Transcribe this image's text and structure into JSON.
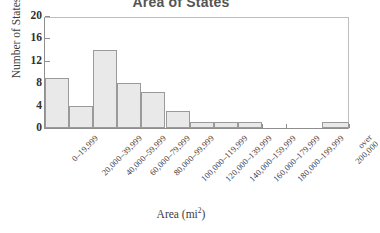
{
  "chart_data": {
    "type": "bar",
    "title": "Area of States",
    "xlabel": "Area (mi",
    "xlabel_sup": "2",
    "xlabel_tail": ")",
    "ylabel": "Number of States",
    "ylim": [
      0,
      20
    ],
    "yticks": [
      0,
      4,
      8,
      12,
      16,
      20
    ],
    "ytick_labels": [
      "0",
      "4",
      "8",
      "12",
      "16",
      "20"
    ],
    "grid": false,
    "legend": "none",
    "bar_color": "#e9e9e9",
    "bar_border_color": "#9a9a9a",
    "axis_color": "#8e8e8e",
    "categories": [
      "0–19,999",
      "20,000–39,999",
      "40,000–59,999",
      "60,000–79,999",
      "80,000–99,999",
      "100,000–119,999",
      "120,000–139,999",
      "140,000–159,999",
      "160,000–179,999",
      "180,000–199,999",
      "over\n200,000"
    ],
    "values": [
      9,
      4,
      14,
      8,
      6.5,
      3,
      1,
      1,
      1,
      0,
      1
    ],
    "separated_last_bin": true
  }
}
